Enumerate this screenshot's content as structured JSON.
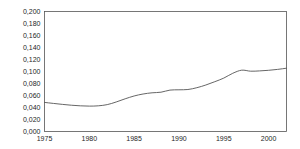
{
  "chart_data": {
    "type": "line",
    "title": "",
    "subtitle": "",
    "xlabel": "",
    "ylabel": "",
    "xlim": [
      1975,
      2002
    ],
    "ylim": [
      0.0,
      0.2
    ],
    "grid": false,
    "legend": null,
    "decimal_separator": ",",
    "line_color": "#555555",
    "axis_color": "#555555",
    "background_color": "#ffffff",
    "x_ticks": [
      1975,
      1980,
      1985,
      1990,
      1995,
      2000
    ],
    "x_tick_labels": [
      "1975",
      "1980",
      "1985",
      "1990",
      "1995",
      "2000"
    ],
    "y_ticks": [
      0.0,
      0.02,
      0.04,
      0.06,
      0.08,
      0.1,
      0.12,
      0.14,
      0.16,
      0.18,
      0.2
    ],
    "y_tick_labels": [
      "0,000",
      "0,020",
      "0,040",
      "0,060",
      "0,080",
      "0,100",
      "0,120",
      "0,140",
      "0,160",
      "0,180",
      "0,200"
    ],
    "x": [
      1975,
      1976,
      1977,
      1978,
      1979,
      1980,
      1981,
      1982,
      1983,
      1984,
      1985,
      1986,
      1987,
      1988,
      1989,
      1990,
      1991,
      1992,
      1993,
      1994,
      1995,
      1996,
      1997,
      1998,
      1999,
      2000,
      2001,
      2002
    ],
    "values": [
      0.0485,
      0.0468,
      0.0452,
      0.0438,
      0.0428,
      0.0423,
      0.0428,
      0.0448,
      0.0492,
      0.0545,
      0.0592,
      0.0625,
      0.0645,
      0.0655,
      0.069,
      0.0695,
      0.07,
      0.073,
      0.0775,
      0.083,
      0.089,
      0.097,
      0.1022,
      0.1005,
      0.101,
      0.102,
      0.1035,
      0.1055
    ],
    "series": [
      {
        "name": "series-1",
        "values": [
          0.0485,
          0.0468,
          0.0452,
          0.0438,
          0.0428,
          0.0423,
          0.0428,
          0.0448,
          0.0492,
          0.0545,
          0.0592,
          0.0625,
          0.0645,
          0.0655,
          0.069,
          0.0695,
          0.07,
          0.073,
          0.0775,
          0.083,
          0.089,
          0.097,
          0.1022,
          0.1005,
          0.101,
          0.102,
          0.1035,
          0.1055
        ]
      }
    ]
  }
}
